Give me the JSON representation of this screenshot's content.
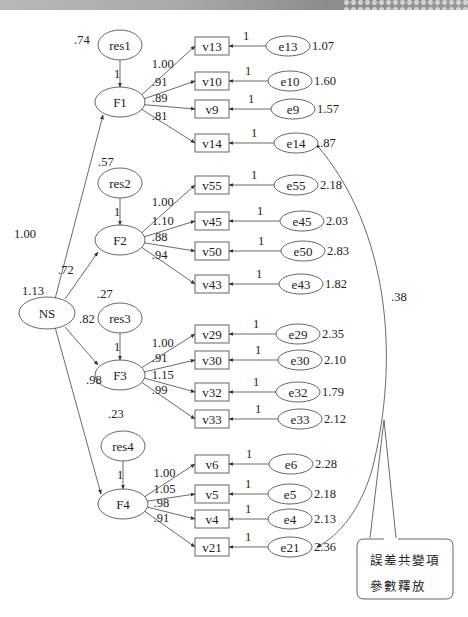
{
  "banner": {
    "present": true
  },
  "diagram": {
    "title": "",
    "latent_exogenous": {
      "id": "NS",
      "label": "NS",
      "variance": "1.13"
    },
    "structural_paths": [
      {
        "from": "NS",
        "to": "F1",
        "label": "1.00"
      },
      {
        "from": "NS",
        "to": "F2",
        "label": ".72"
      },
      {
        "from": "NS",
        "to": "F3",
        "label": ".82"
      },
      {
        "from": "NS",
        "to": "F4",
        "label": ".98"
      }
    ],
    "factors": [
      {
        "id": "F1",
        "label": "F1",
        "residual": "res1",
        "residual_variance": ".74",
        "residual_path": "1",
        "indicators": [
          {
            "id": "v13",
            "loading": "1.00",
            "error": "e13",
            "error_path": "1",
            "error_variance": "1.07"
          },
          {
            "id": "v10",
            "loading": ".91",
            "error": "e10",
            "error_path": "1",
            "error_variance": "1.60"
          },
          {
            "id": "v9",
            "loading": ".89",
            "error": "e9",
            "error_path": "1",
            "error_variance": "1.57"
          },
          {
            "id": "v14",
            "loading": ".81",
            "error": "e14",
            "error_path": "1",
            "error_variance": ".87"
          }
        ]
      },
      {
        "id": "F2",
        "label": "F2",
        "residual": "res2",
        "residual_variance": ".57",
        "residual_path": "1",
        "indicators": [
          {
            "id": "v55",
            "loading": "1.00",
            "error": "e55",
            "error_path": "1",
            "error_variance": "2.18"
          },
          {
            "id": "v45",
            "loading": "1.10",
            "error": "e45",
            "error_path": "1",
            "error_variance": "2.03"
          },
          {
            "id": "v50",
            "loading": ".88",
            "error": "e50",
            "error_path": "1",
            "error_variance": "2.83"
          },
          {
            "id": "v43",
            "loading": ".94",
            "error": "e43",
            "error_path": "1",
            "error_variance": "1.82"
          }
        ]
      },
      {
        "id": "F3",
        "label": "F3",
        "residual": "res3",
        "residual_variance": ".27",
        "residual_path": "1",
        "indicators": [
          {
            "id": "v29",
            "loading": "1.00",
            "error": "e29",
            "error_path": "1",
            "error_variance": "2.35"
          },
          {
            "id": "v30",
            "loading": ".91",
            "error": "e30",
            "error_path": "1",
            "error_variance": "2.10"
          },
          {
            "id": "v32",
            "loading": "1.15",
            "error": "e32",
            "error_path": "1",
            "error_variance": "1.79"
          },
          {
            "id": "v33",
            "loading": ".99",
            "error": "e33",
            "error_path": "1",
            "error_variance": "2.12"
          }
        ]
      },
      {
        "id": "F4",
        "label": "F4",
        "residual": "res4",
        "residual_variance": ".23",
        "residual_path": "1",
        "indicators": [
          {
            "id": "v6",
            "loading": "1.00",
            "error": "e6",
            "error_path": "1",
            "error_variance": "2.28"
          },
          {
            "id": "v5",
            "loading": "1.05",
            "error": "e5",
            "error_path": "1",
            "error_variance": "2.18"
          },
          {
            "id": "v4",
            "loading": ".98",
            "error": "e4",
            "error_path": "1",
            "error_variance": "2.13"
          },
          {
            "id": "v21",
            "loading": ".91",
            "error": "e21",
            "error_path": "1",
            "error_variance": "2.36"
          }
        ]
      }
    ],
    "error_covariance": {
      "between": [
        "e14",
        "e21"
      ],
      "label": ".38"
    },
    "callout": {
      "line1": "誤差共變項",
      "line2": "參數釋放"
    }
  }
}
